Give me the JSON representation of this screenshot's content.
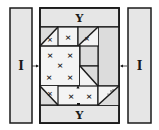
{
  "diagram": {
    "type": "quilt-block-assembly",
    "left_strip": {
      "label": "I"
    },
    "right_strip": {
      "label": "I"
    },
    "top_strip": {
      "label": "Y"
    },
    "bottom_strip": {
      "label": "Y"
    },
    "center_marks": [
      "×",
      "×",
      "×",
      "×",
      "×"
    ],
    "colors": {
      "line": "#1a1a1a",
      "strip_fill": "#e6e6e6",
      "light_fill": "#f4f4f4",
      "dark_fill": "#dcdcdc"
    }
  }
}
